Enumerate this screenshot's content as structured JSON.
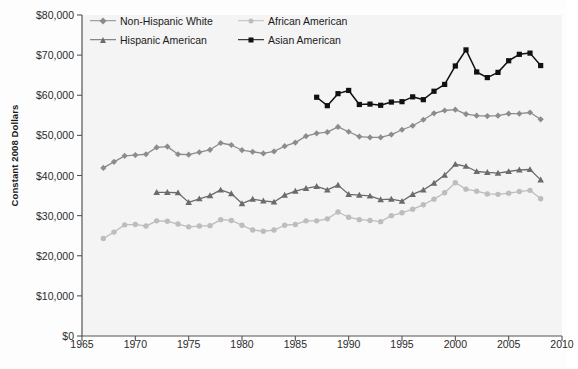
{
  "chart_data": {
    "type": "line",
    "title": "",
    "xlabel": "",
    "ylabel": "Constant 2008 Dollars",
    "xlim": [
      1965,
      2010
    ],
    "ylim": [
      0,
      80000
    ],
    "xticks": [
      1965,
      1970,
      1975,
      1980,
      1985,
      1990,
      1995,
      2000,
      2005,
      2010
    ],
    "xtick_labels": [
      "1965",
      "1970",
      "1975",
      "1980",
      "1985",
      "1990",
      "1995",
      "2000",
      "2005",
      "2010"
    ],
    "yticks": [
      0,
      10000,
      20000,
      30000,
      40000,
      50000,
      60000,
      70000,
      80000
    ],
    "ytick_labels": [
      "$0",
      "$10,000",
      "$20,000",
      "$30,000",
      "$40,000",
      "$50,000",
      "$60,000",
      "$70,000",
      "$80,000"
    ],
    "grid": false,
    "legend_position": "top-left-inside",
    "series": [
      {
        "name": "Non-Hispanic White",
        "color": "#8c8c8c",
        "marker": "diamond",
        "x": [
          1967,
          1968,
          1969,
          1970,
          1971,
          1972,
          1973,
          1974,
          1975,
          1976,
          1977,
          1978,
          1979,
          1980,
          1981,
          1982,
          1983,
          1984,
          1985,
          1986,
          1987,
          1988,
          1989,
          1990,
          1991,
          1992,
          1993,
          1994,
          1995,
          1996,
          1997,
          1998,
          1999,
          2000,
          2001,
          2002,
          2003,
          2004,
          2005,
          2006,
          2007,
          2008
        ],
        "values": [
          41900,
          43400,
          44900,
          45100,
          45300,
          47000,
          47200,
          45300,
          45200,
          45800,
          46400,
          48100,
          47600,
          46300,
          45900,
          45500,
          46000,
          47300,
          48200,
          49800,
          50500,
          50800,
          52100,
          50900,
          49700,
          49500,
          49500,
          50200,
          51400,
          52400,
          53900,
          55500,
          56200,
          56400,
          55300,
          54900,
          54800,
          54900,
          55400,
          55400,
          55700,
          54000
        ]
      },
      {
        "name": "Hispanic American",
        "color": "#6b6b6b",
        "marker": "triangle",
        "x": [
          1972,
          1973,
          1974,
          1975,
          1976,
          1977,
          1978,
          1979,
          1980,
          1981,
          1982,
          1983,
          1984,
          1985,
          1986,
          1987,
          1988,
          1989,
          1990,
          1991,
          1992,
          1993,
          1994,
          1995,
          1996,
          1997,
          1998,
          1999,
          2000,
          2001,
          2002,
          2003,
          2004,
          2005,
          2006,
          2007,
          2008
        ],
        "values": [
          35800,
          35800,
          35700,
          33300,
          34200,
          35000,
          36400,
          35500,
          33000,
          34100,
          33700,
          33400,
          35100,
          36100,
          36800,
          37300,
          36400,
          37600,
          35300,
          35100,
          34900,
          34000,
          34100,
          33600,
          35300,
          36400,
          38100,
          40100,
          42800,
          42300,
          41000,
          40800,
          40600,
          41000,
          41400,
          41500,
          38900
        ]
      },
      {
        "name": "African American",
        "color": "#bdbdbd",
        "marker": "circle",
        "x": [
          1967,
          1968,
          1969,
          1970,
          1971,
          1972,
          1973,
          1974,
          1975,
          1976,
          1977,
          1978,
          1979,
          1980,
          1981,
          1982,
          1983,
          1984,
          1985,
          1986,
          1987,
          1988,
          1989,
          1990,
          1991,
          1992,
          1993,
          1994,
          1995,
          1996,
          1997,
          1998,
          1999,
          2000,
          2001,
          2002,
          2003,
          2004,
          2005,
          2006,
          2007,
          2008
        ],
        "values": [
          24300,
          25900,
          27700,
          27800,
          27400,
          28700,
          28600,
          27900,
          27200,
          27400,
          27500,
          29000,
          28800,
          27600,
          26400,
          26100,
          26400,
          27600,
          27800,
          28700,
          28700,
          29200,
          30900,
          29600,
          29000,
          28800,
          28500,
          30000,
          30700,
          31600,
          32700,
          34100,
          35700,
          38200,
          36600,
          36100,
          35400,
          35300,
          35600,
          36000,
          36300,
          34200
        ]
      },
      {
        "name": "Asian American",
        "color": "#111111",
        "marker": "square",
        "x": [
          1987,
          1988,
          1989,
          1990,
          1991,
          1992,
          1993,
          1994,
          1995,
          1996,
          1997,
          1998,
          1999,
          2000,
          2001,
          2002,
          2003,
          2004,
          2005,
          2006,
          2007,
          2008
        ],
        "values": [
          59500,
          57400,
          60400,
          61200,
          57700,
          57800,
          57500,
          58300,
          58400,
          59600,
          58900,
          61000,
          62700,
          67300,
          71300,
          65800,
          64400,
          65700,
          68600,
          70200,
          70500,
          67400
        ]
      }
    ]
  },
  "legend": {
    "items": [
      {
        "label": "Non-Hispanic White",
        "series": 0
      },
      {
        "label": "African American",
        "series": 2
      },
      {
        "label": "Hispanic American",
        "series": 1
      },
      {
        "label": "Asian American",
        "series": 3
      }
    ]
  },
  "caption": ""
}
